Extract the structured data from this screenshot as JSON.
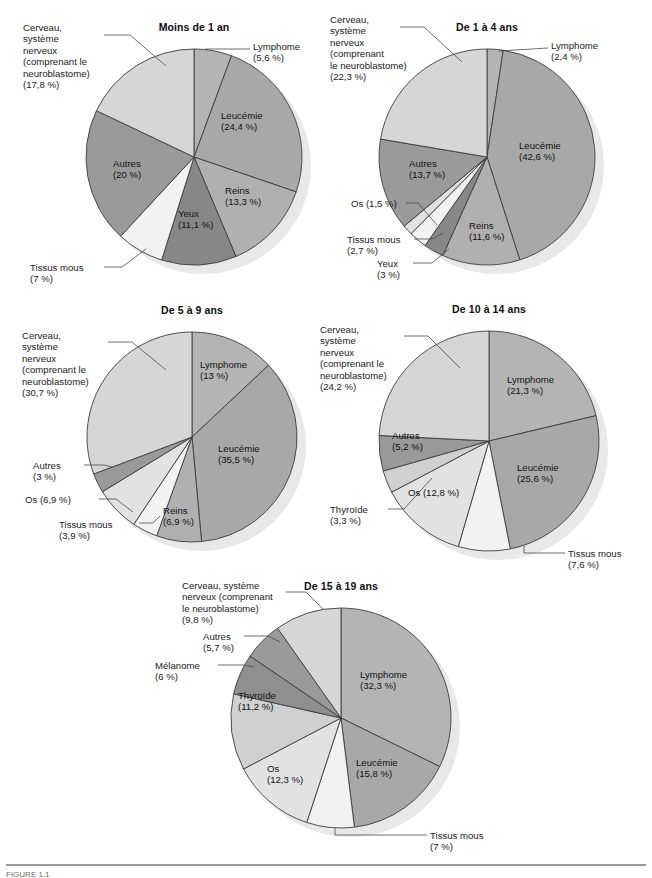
{
  "document": {
    "figure_caption": "FIGURE 1.1",
    "background_color": "#ffffff"
  },
  "palette": {
    "leucemie": "#a8a8a8",
    "lymphome": "#b4b4b4",
    "cerveau": "#d6d6d6",
    "autres": "#9a9a9a",
    "reins": "#b0b0b0",
    "yeux": "#878787",
    "tissus_mous": "#f2f2f2",
    "os": "#e2e2e2",
    "thyroide": "#d0d0d0",
    "melanome": "#8f8f8f",
    "outline": "#3d3d3d",
    "shadow": "#e8e8e8",
    "leader_line": "#4a4a4a"
  },
  "chart_data": [
    {
      "id": "moins-de-1-an",
      "type": "pie",
      "title": "Moins de 1 an",
      "categories": [
        "Lymphome",
        "Leucémie",
        "Reins",
        "Yeux",
        "Tissus mous",
        "Autres",
        "Cerveau, système nerveux (comprenant le neuroblastome)"
      ],
      "values": [
        5.6,
        24.4,
        13.3,
        11.1,
        7,
        20,
        17.8
      ],
      "value_labels": [
        "(5,6 %)",
        "(24,4 %)",
        "(13,3 %)",
        "(11,1 %)",
        "(7 %)",
        "(20 %)",
        "(17,8 %)"
      ],
      "colors": [
        "#b4b4b4",
        "#a8a8a8",
        "#b0b0b0",
        "#878787",
        "#f2f2f2",
        "#9a9a9a",
        "#d6d6d6"
      ],
      "start_angle": 0,
      "cx": 194,
      "cy": 157,
      "r": 108,
      "labels": [
        {
          "text": "Lymphome\n(5,6 %)",
          "mode": "callout",
          "x": 253,
          "y": 41,
          "line": [
            [
              250,
              49
            ],
            [
              205,
              49
            ]
          ]
        },
        {
          "text": "Leucémie\n(24,4 %)",
          "mode": "inside",
          "x": 221,
          "y": 110
        },
        {
          "text": "Reins\n(13,3 %)",
          "mode": "inside",
          "x": 225,
          "y": 185
        },
        {
          "text": "Yeux\n(11,1 %)",
          "mode": "inside",
          "x": 178,
          "y": 208
        },
        {
          "text": "Tissus mous\n(7 %)",
          "mode": "callout",
          "x": 30,
          "y": 262,
          "line": [
            [
              104,
              267
            ],
            [
              122,
              267
            ],
            [
              146,
              249
            ]
          ]
        },
        {
          "text": "Autres\n(20 %)",
          "mode": "inside",
          "x": 113,
          "y": 158
        },
        {
          "text": "Cerveau,\nsystème\nnerveux\n(comprenant le\nneuroblastome)\n(17,8 %)",
          "mode": "callout",
          "x": 23,
          "y": 22,
          "line": [
            [
              104,
              35
            ],
            [
              130,
              35
            ],
            [
              166,
              66
            ]
          ]
        }
      ]
    },
    {
      "id": "de-1-a-4-ans",
      "type": "pie",
      "title": "De 1 à 4 ans",
      "categories": [
        "Lymphome",
        "Leucémie",
        "Reins",
        "Yeux",
        "Tissus mous",
        "Os",
        "Autres",
        "Cerveau, système nerveux (comprenant le neuroblastome)"
      ],
      "values": [
        2.4,
        42.6,
        11.6,
        3,
        2.7,
        1.5,
        13.7,
        22.3
      ],
      "value_labels": [
        "(2,4 %)",
        "(42,6 %)",
        "(11,6 %)",
        "(3 %)",
        "(2,7 %)",
        "(1,5 %)",
        "(13,7 %)",
        "(22,3 %)"
      ],
      "colors": [
        "#b4b4b4",
        "#a8a8a8",
        "#b0b0b0",
        "#878787",
        "#f2f2f2",
        "#e2e2e2",
        "#9a9a9a",
        "#d6d6d6"
      ],
      "start_angle": 0,
      "cx": 487,
      "cy": 157,
      "r": 108,
      "labels": [
        {
          "text": "Lymphome\n(2,4 %)",
          "mode": "callout",
          "x": 551,
          "y": 40,
          "line": [
            [
              548,
              48
            ],
            [
              499,
              51
            ]
          ]
        },
        {
          "text": "Leucémie\n(42,6 %)",
          "mode": "inside",
          "x": 519,
          "y": 140
        },
        {
          "text": "Reins\n(11,6 %)",
          "mode": "inside",
          "x": 469,
          "y": 220
        },
        {
          "text": "Yeux\n(3 %)",
          "mode": "callout",
          "x": 377,
          "y": 258,
          "line": [
            [
              413,
              263
            ],
            [
              432,
              263
            ],
            [
              449,
              249
            ]
          ]
        },
        {
          "text": "Tissus mous\n(2,7 %)",
          "mode": "callout",
          "x": 347,
          "y": 234,
          "line": [
            [
              414,
              239
            ],
            [
              432,
              239
            ],
            [
              443,
              233
            ]
          ]
        },
        {
          "text": "Os (1,5 %)",
          "mode": "callout",
          "x": 351,
          "y": 198,
          "line": [
            [
              406,
              203
            ],
            [
              418,
              203
            ],
            [
              437,
              225
            ]
          ]
        },
        {
          "text": "Autres\n(13,7 %)",
          "mode": "inside",
          "x": 409,
          "y": 158
        },
        {
          "text": "Cerveau,\nsystème\nnerveux\n(comprenant\nle neuroblastome)\n(22,3 %)",
          "mode": "callout",
          "x": 330,
          "y": 14,
          "line": [
            [
              400,
              27
            ],
            [
              424,
              27
            ],
            [
              462,
              62
            ]
          ]
        }
      ]
    },
    {
      "id": "de-5-a-9-ans",
      "type": "pie",
      "title": "De 5 à 9 ans",
      "categories": [
        "Lymphome",
        "Leucémie",
        "Reins",
        "Tissus mous",
        "Os",
        "Autres",
        "Cerveau, système nerveux (comprenant le neuroblastome)"
      ],
      "values": [
        13,
        35.5,
        6.9,
        3.9,
        6.9,
        3,
        30.7
      ],
      "value_labels": [
        "(13 %)",
        "(35,5 %)",
        "(6,9 %)",
        "(3,9 %)",
        "(6,9 %)",
        "(3 %)",
        "(30,7 %)"
      ],
      "colors": [
        "#b4b4b4",
        "#a8a8a8",
        "#b0b0b0",
        "#f2f2f2",
        "#e2e2e2",
        "#9a9a9a",
        "#d6d6d6"
      ],
      "start_angle": 0,
      "cx": 192,
      "cy": 437,
      "r": 105,
      "labels": [
        {
          "text": "Lymphome\n(13 %)",
          "mode": "inside",
          "x": 200,
          "y": 359
        },
        {
          "text": "Leucémie\n(35,5 %)",
          "mode": "inside",
          "x": 218,
          "y": 443
        },
        {
          "text": "Reins\n(6,9 %)",
          "mode": "inside",
          "x": 163,
          "y": 505
        },
        {
          "text": "Tissus mous\n(3,9 %)",
          "mode": "callout",
          "x": 59,
          "y": 519,
          "line": [
            [
              139,
              523
            ],
            [
              153,
              523
            ],
            [
              160,
              516
            ]
          ]
        },
        {
          "text": "Os (6,9 %)",
          "mode": "callout",
          "x": 25,
          "y": 494,
          "line": [
            [
              99,
              499
            ],
            [
              116,
              499
            ],
            [
              133,
              512
            ]
          ]
        },
        {
          "text": "Autres\n(3 %)",
          "mode": "callout",
          "x": 33,
          "y": 460,
          "line": [
            [
              84,
              465
            ],
            [
              104,
              465
            ],
            [
              112,
              467
            ]
          ]
        },
        {
          "text": "Cerveau,\nsystème\nnerveux\n(comprenant le\nneuroblastome)\n(30,7 %)",
          "mode": "callout",
          "x": 22,
          "y": 330,
          "line": [
            [
              108,
              342
            ],
            [
              132,
              342
            ],
            [
              166,
              370
            ]
          ]
        }
      ]
    },
    {
      "id": "de-10-a-14-ans",
      "type": "pie",
      "title": "De 10 à 14 ans",
      "categories": [
        "Lymphome",
        "Leucémie",
        "Tissus mous",
        "Os",
        "Thyroïde",
        "Autres",
        "Cerveau, système nerveux (comprenant le neuroblastome)"
      ],
      "values": [
        21.3,
        25.6,
        7.6,
        12.8,
        3.3,
        5.2,
        24.2
      ],
      "value_labels": [
        "(21,3 %)",
        "(25,6 %)",
        "(7,6 %)",
        "(12,8 %)",
        "(3,3 %)",
        "(5,2 %)",
        "(24,2 %)"
      ],
      "colors": [
        "#b4b4b4",
        "#a8a8a8",
        "#f2f2f2",
        "#e2e2e2",
        "#d0d0d0",
        "#9a9a9a",
        "#d6d6d6"
      ],
      "start_angle": 0,
      "cx": 489,
      "cy": 441,
      "r": 110,
      "labels": [
        {
          "text": "Lymphome\n(21,3 %)",
          "mode": "inside",
          "x": 507,
          "y": 374
        },
        {
          "text": "Leucémie\n(25,6 %)",
          "mode": "inside",
          "x": 517,
          "y": 462
        },
        {
          "text": "Tissus mous\n(7,6 %)",
          "mode": "callout",
          "x": 568,
          "y": 548,
          "line": [
            [
              565,
              553
            ],
            [
              524,
              553
            ],
            [
              524,
              546
            ]
          ]
        },
        {
          "text": "Os (12,8 %)",
          "mode": "inside",
          "x": 408,
          "y": 487
        },
        {
          "text": "Thyroïde\n(3,3 %)",
          "mode": "callout",
          "x": 330,
          "y": 504,
          "line": [
            [
              388,
              509
            ],
            [
              404,
              509
            ],
            [
              432,
              478
            ]
          ]
        },
        {
          "text": "Autres\n(5,2 %)",
          "mode": "inside",
          "x": 392,
          "y": 430
        },
        {
          "text": "Cerveau,\nsystème\nnerveux\n(comprenant le\nneuroblastome)\n(24,2 %)",
          "mode": "callout",
          "x": 320,
          "y": 324,
          "line": [
            [
              404,
              336
            ],
            [
              428,
              336
            ],
            [
              460,
              368
            ]
          ]
        }
      ]
    },
    {
      "id": "de-15-a-19-ans",
      "type": "pie",
      "title": "De 15 à 19 ans",
      "categories": [
        "Lymphome",
        "Leucémie",
        "Tissus mous",
        "Os",
        "Thyroïde",
        "Mélanome",
        "Autres",
        "Cerveau, système nerveux (comprenant le neuroblastome)"
      ],
      "values": [
        32.3,
        15.8,
        7,
        12.3,
        11.2,
        6,
        5.7,
        9.8
      ],
      "value_labels": [
        "(32,3 %)",
        "(15,8 %)",
        "(7 %)",
        "(12,3 %)",
        "(11,2 %)",
        "(6 %)",
        "(5,7 %)",
        "(9,8 %)"
      ],
      "colors": [
        "#b4b4b4",
        "#a8a8a8",
        "#f2f2f2",
        "#e2e2e2",
        "#d0d0d0",
        "#8f8f8f",
        "#9a9a9a",
        "#d6d6d6"
      ],
      "start_angle": 0,
      "cx": 341,
      "cy": 718,
      "r": 110,
      "labels": [
        {
          "text": "Lymphome\n(32,3 %)",
          "mode": "inside",
          "x": 360,
          "y": 669
        },
        {
          "text": "Leucémie\n(15,8 %)",
          "mode": "inside",
          "x": 356,
          "y": 757
        },
        {
          "text": "Tissus mous\n(7 %)",
          "mode": "callout",
          "x": 430,
          "y": 830,
          "line": [
            [
              427,
              835
            ],
            [
              335,
              835
            ],
            [
              335,
              828
            ]
          ]
        },
        {
          "text": "Os\n(12,3 %)",
          "mode": "inside",
          "x": 267,
          "y": 763
        },
        {
          "text": "Thyroïde\n(11,2 %)",
          "mode": "inside",
          "x": 238,
          "y": 690
        },
        {
          "text": "Mélanome\n(6 %)",
          "mode": "callout",
          "x": 155,
          "y": 660,
          "line": [
            [
              218,
              665
            ],
            [
              243,
              665
            ],
            [
              254,
              667
            ]
          ]
        },
        {
          "text": "Autres\n(5,7 %)",
          "mode": "callout",
          "x": 203,
          "y": 631,
          "line": [
            [
              244,
              636
            ],
            [
              268,
              636
            ],
            [
              280,
              642
            ]
          ]
        },
        {
          "text": "Cerveau, système\nnerveux (comprenant\nle neuroblastome)\n(9,8 %)",
          "mode": "callout",
          "x": 182,
          "y": 580,
          "line": [
            [
              286,
              592
            ],
            [
              306,
              592
            ],
            [
              324,
              610
            ]
          ]
        }
      ]
    }
  ]
}
